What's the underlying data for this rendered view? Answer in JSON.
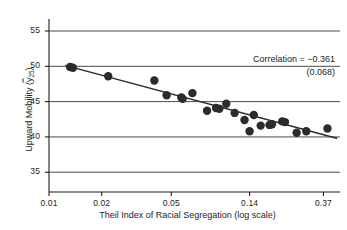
{
  "chart_data": {
    "type": "scatter",
    "title": "",
    "xlabel": "Theil Index of Racial Segregation (log scale)",
    "ylabel": "Upward Mobility (ȳ25)",
    "ylabel_parts": {
      "prefix": "Upward Mobility (",
      "ybar": "y",
      "subscript": "25",
      "suffix": ")"
    },
    "x_scale": "log",
    "y_scale": "linear",
    "xticks": [
      0.01,
      0.02,
      0.05,
      0.14,
      0.37
    ],
    "xtick_labels": [
      "0.01",
      "0.02",
      "0.05",
      "0.14",
      "0.37"
    ],
    "yticks": [
      35,
      40,
      45,
      50,
      55
    ],
    "ytick_labels": [
      "35",
      "40",
      "45",
      "50",
      "55"
    ],
    "xlim": [
      0.01,
      0.46
    ],
    "ylim": [
      32.2,
      56.7
    ],
    "grid": "horizontal",
    "legend": "none",
    "marker": {
      "shape": "circle",
      "color": "#2b2b2b",
      "size": 4.2
    },
    "points": [
      {
        "x": 0.0132,
        "y": 49.9
      },
      {
        "x": 0.0137,
        "y": 49.8
      },
      {
        "x": 0.0218,
        "y": 48.6
      },
      {
        "x": 0.04,
        "y": 48.0
      },
      {
        "x": 0.047,
        "y": 45.9
      },
      {
        "x": 0.057,
        "y": 45.6
      },
      {
        "x": 0.058,
        "y": 45.4
      },
      {
        "x": 0.066,
        "y": 46.2
      },
      {
        "x": 0.08,
        "y": 43.7
      },
      {
        "x": 0.09,
        "y": 44.1
      },
      {
        "x": 0.094,
        "y": 44.0
      },
      {
        "x": 0.103,
        "y": 44.7
      },
      {
        "x": 0.115,
        "y": 43.4
      },
      {
        "x": 0.131,
        "y": 42.4
      },
      {
        "x": 0.14,
        "y": 40.8
      },
      {
        "x": 0.148,
        "y": 43.1
      },
      {
        "x": 0.162,
        "y": 41.6
      },
      {
        "x": 0.182,
        "y": 41.7
      },
      {
        "x": 0.188,
        "y": 41.8
      },
      {
        "x": 0.215,
        "y": 42.2
      },
      {
        "x": 0.223,
        "y": 42.1
      },
      {
        "x": 0.26,
        "y": 40.6
      },
      {
        "x": 0.295,
        "y": 40.8
      },
      {
        "x": 0.39,
        "y": 41.2
      }
    ],
    "fit_line": {
      "type": "linear-in-log-x",
      "x_start": 0.0125,
      "y_start": 50.1,
      "x_end": 0.44,
      "y_end": 39.8,
      "color": "#2b2b2b"
    },
    "annotations": {
      "correlation_label": "Correlation = −0.361",
      "standard_error": "(0.068)"
    }
  },
  "axes": {
    "spine_color": "#1d1d1d",
    "grid_color": "#4a4a4a"
  }
}
